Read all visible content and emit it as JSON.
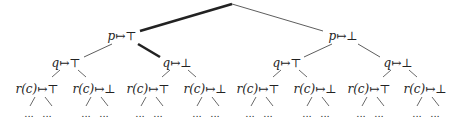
{
  "tree": {
    "root": {
      "x": 232,
      "y": 4
    },
    "level1": [
      {
        "label_var": "p",
        "label_val": "↦⊤",
        "x": 122,
        "y": 36
      },
      {
        "label_var": "p",
        "label_val": "↦⊥",
        "x": 343,
        "y": 36
      }
    ],
    "level2": [
      {
        "label_var": "q",
        "label_val": "↦⊤",
        "x": 66,
        "y": 63
      },
      {
        "label_var": "q",
        "label_val": "↦⊥",
        "x": 177,
        "y": 63
      },
      {
        "label_var": "q",
        "label_val": "↦⊤",
        "x": 287,
        "y": 63
      },
      {
        "label_var": "q",
        "label_val": "↦⊥",
        "x": 398,
        "y": 63
      }
    ],
    "level3": [
      {
        "label_var": "r(c)",
        "label_val": "↦⊤",
        "x": 37,
        "y": 89
      },
      {
        "label_var": "r(c)",
        "label_val": "↦⊥",
        "x": 94,
        "y": 89
      },
      {
        "label_var": "r(c)",
        "label_val": "↦⊤",
        "x": 148,
        "y": 89
      },
      {
        "label_var": "r(c)",
        "label_val": "↦⊥",
        "x": 205,
        "y": 89
      },
      {
        "label_var": "r(c)",
        "label_val": "↦⊤",
        "x": 258,
        "y": 89
      },
      {
        "label_var": "r(c)",
        "label_val": "↦⊥",
        "x": 315,
        "y": 89
      },
      {
        "label_var": "r(c)",
        "label_val": "↦⊤",
        "x": 369,
        "y": 89
      },
      {
        "label_var": "r(c)",
        "label_val": "↦⊥",
        "x": 425,
        "y": 89
      }
    ],
    "leaf_text": "...",
    "highlighted_path": [
      "root",
      "p↦⊤",
      "q↦⊥"
    ]
  }
}
